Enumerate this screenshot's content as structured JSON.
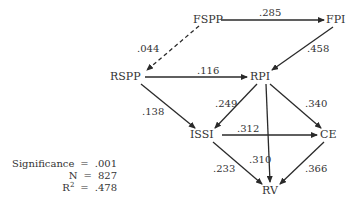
{
  "diagram": {
    "type": "path-diagram",
    "nodes": {
      "fspp": "FSPP",
      "fpi": "FPI",
      "rspp": "RSPP",
      "rpi": "RPI",
      "issi": "ISSI",
      "ce": "CE",
      "rv": "RV"
    },
    "edges": [
      {
        "from": "FSPP",
        "to": "FPI",
        "coef": ".285",
        "style": "solid"
      },
      {
        "from": "FSPP",
        "to": "RSPP",
        "coef": ".044",
        "style": "dashed"
      },
      {
        "from": "FPI",
        "to": "RPI",
        "coef": ".458",
        "style": "solid"
      },
      {
        "from": "RSPP",
        "to": "RPI",
        "coef": ".116",
        "style": "solid"
      },
      {
        "from": "RSPP",
        "to": "ISSI",
        "coef": ".138",
        "style": "solid"
      },
      {
        "from": "RPI",
        "to": "ISSI",
        "coef": ".249",
        "style": "solid"
      },
      {
        "from": "RPI",
        "to": "CE",
        "coef": ".340",
        "style": "solid"
      },
      {
        "from": "RPI",
        "to": "RV",
        "coef": ".310",
        "style": "solid"
      },
      {
        "from": "ISSI",
        "to": "CE",
        "coef": ".312",
        "style": "solid"
      },
      {
        "from": "ISSI",
        "to": "RV",
        "coef": ".233",
        "style": "solid"
      },
      {
        "from": "CE",
        "to": "RV",
        "coef": ".366",
        "style": "solid"
      }
    ],
    "coefs": {
      "fspp_fpi": ".285",
      "fspp_rspp": ".044",
      "fpi_rpi": ".458",
      "rspp_rpi": ".116",
      "rspp_issi": ".138",
      "rpi_issi": ".249",
      "rpi_ce": ".340",
      "rpi_rv": ".310",
      "issi_ce": ".312",
      "issi_rv": ".233",
      "ce_rv": ".366"
    }
  },
  "stats": {
    "significance_label": "Significance",
    "significance_value": ".001",
    "n_label": "N",
    "n_value": "827",
    "r2_label": "R",
    "r2_sup": "2",
    "r2_value": ".478",
    "equals": "="
  }
}
